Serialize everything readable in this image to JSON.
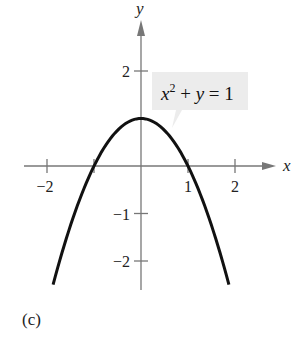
{
  "chart_data": {
    "type": "line",
    "title": "",
    "panel_label": "(c)",
    "xlabel": "x",
    "ylabel": "y",
    "xlim": [
      -2.5,
      2.7
    ],
    "ylim": [
      -2.5,
      3
    ],
    "x_ticks": [
      {
        "value": -2,
        "label": "−2"
      },
      {
        "value": -1,
        "label": ""
      },
      {
        "value": 1,
        "label": "1"
      },
      {
        "value": 2,
        "label": "2"
      }
    ],
    "y_ticks": [
      {
        "value": 2,
        "label": "2"
      },
      {
        "value": -1,
        "label": "−1"
      },
      {
        "value": -2,
        "label": "−2"
      }
    ],
    "grid": false,
    "series": [
      {
        "name": "x^2 + y = 1",
        "equation": "y = 1 - x^2",
        "x": [
          -1.87,
          -1.5,
          -1,
          -0.5,
          0,
          0.5,
          1,
          1.5,
          1.87
        ],
        "y": [
          -2.5,
          -1.25,
          0,
          0.75,
          1,
          0.75,
          0,
          -1.25,
          -2.5
        ],
        "color": "#111111"
      }
    ],
    "annotations": [
      {
        "text": "x² + y = 1",
        "base": "x",
        "sup": "2",
        "rest": " + y = 1",
        "points_to": [
          0.7,
          0.5
        ],
        "box_color": "#ececec"
      }
    ]
  }
}
